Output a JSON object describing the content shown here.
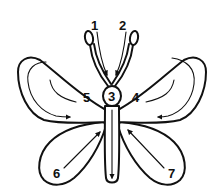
{
  "diagram": {
    "colors": {
      "line": "#111111",
      "background": "#ffffff"
    },
    "labels": [
      {
        "id": "1",
        "text": "1",
        "refers_to": "left antenna stroke"
      },
      {
        "id": "2",
        "text": "2",
        "refers_to": "right antenna stroke"
      },
      {
        "id": "3",
        "text": "3",
        "refers_to": "head and body stroke"
      },
      {
        "id": "4",
        "text": "4",
        "refers_to": "upper right wing stroke"
      },
      {
        "id": "5",
        "text": "5",
        "refers_to": "upper left wing stroke"
      },
      {
        "id": "6",
        "text": "6",
        "refers_to": "lower left wing stroke"
      },
      {
        "id": "7",
        "text": "7",
        "refers_to": "lower right wing stroke"
      }
    ]
  }
}
